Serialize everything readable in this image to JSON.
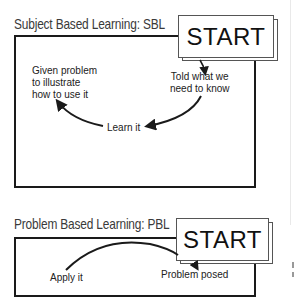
{
  "diagrams": [
    {
      "title": "Subject Based Learning: SBL",
      "start_label": "START",
      "steps": [
        {
          "label": "Told what we\nneed to know"
        },
        {
          "label": "Learn it"
        },
        {
          "label": "Given problem\nto illustrate\nhow to use it"
        }
      ]
    },
    {
      "title": "Problem Based Learning: PBL",
      "start_label": "START",
      "steps": [
        {
          "label": "Problem posed"
        },
        {
          "label": "Apply it"
        }
      ]
    }
  ],
  "colors": {
    "line": "#1a1a1a",
    "title_text": "#3a3a3a",
    "background": "#ffffff"
  }
}
